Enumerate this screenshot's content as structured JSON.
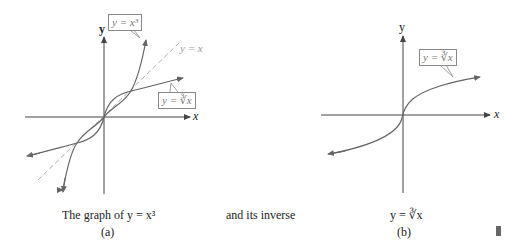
{
  "figure": {
    "left_panel": {
      "axis_x_label": "x",
      "axis_y_label": "y",
      "label_cubic": "y = x³",
      "label_identity": "y = x",
      "label_cuberoot": "y = ∛x",
      "caption_line1": "The graph of y = x³",
      "caption_tag": "(a)"
    },
    "middle_caption": "and its inverse",
    "right_panel": {
      "axis_x_label": "x",
      "axis_y_label": "y",
      "label_cuberoot": "y = ∛x",
      "caption_line1": "y = ∛x",
      "caption_tag": "(b)"
    },
    "colors": {
      "axis": "#333333",
      "curve": "#666666",
      "dashed": "#aaaaaa",
      "label_text": "#777777"
    }
  }
}
